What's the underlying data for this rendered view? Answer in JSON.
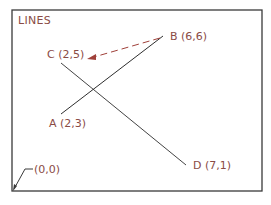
{
  "title": "LINES",
  "colors": {
    "frame": "#3a3a3a",
    "lines": "#2e2e2e",
    "labels": "#8a4b45",
    "arrow": "#a0413a"
  },
  "points": {
    "A": {
      "label": "A (2,3)"
    },
    "B": {
      "label": "B (6,6)"
    },
    "C": {
      "label": "C (2,5)"
    },
    "D": {
      "label": "D (7,1)"
    },
    "origin": {
      "label": "(0,0)"
    }
  },
  "lines": [
    {
      "from": "A",
      "to": "B"
    },
    {
      "from": "C",
      "to": "D"
    }
  ],
  "annotations": [
    {
      "type": "dashed-arrow",
      "from": "B",
      "to": "C"
    },
    {
      "type": "leader",
      "target": "origin"
    }
  ]
}
